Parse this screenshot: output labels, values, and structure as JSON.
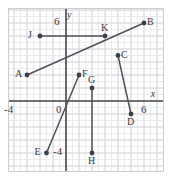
{
  "figure": {
    "title": "",
    "width_px": 171,
    "height_px": 178,
    "frame_color": "#c9ccd1",
    "axis_color": "#4a4a4a",
    "grid_major_color": "#d6d8dc",
    "grid_minor_color": "#ececee",
    "point_color": "#3f3f46",
    "segment_color": "#50505a",
    "background": "#ffffff"
  },
  "axes": {
    "x_label": "x",
    "y_label": "y",
    "xlim": [
      -4.6,
      7.4
    ],
    "ylim": [
      -5.6,
      7.0
    ],
    "unit_px": 13,
    "grid": true,
    "minor_per_major": 2,
    "ticks": {
      "x": [
        {
          "value": -4,
          "label": "-4"
        },
        {
          "value": 6,
          "label": "6"
        }
      ],
      "y": [
        {
          "value": 6,
          "label": "6"
        },
        {
          "value": -4,
          "label": "-4"
        }
      ],
      "origin_label": "0"
    }
  },
  "chart_data": {
    "type": "scatter",
    "title": "",
    "xlabel": "x",
    "ylabel": "y",
    "xlim": [
      -4.6,
      7.4
    ],
    "ylim": [
      -5.6,
      7.0
    ],
    "grid": true,
    "legend": "none",
    "points": [
      {
        "name": "A",
        "x": -3.0,
        "y": 2.0,
        "label": "A",
        "label_side": "left"
      },
      {
        "name": "B",
        "x": 6.0,
        "y": 6.0,
        "label": "B",
        "label_side": "right"
      },
      {
        "name": "C",
        "x": 4.0,
        "y": 3.5,
        "label": "C",
        "label_side": "right"
      },
      {
        "name": "D",
        "x": 5.0,
        "y": -1.0,
        "label": "D",
        "label_side": "below"
      },
      {
        "name": "E",
        "x": -1.5,
        "y": -4.0,
        "label": "E",
        "label_side": "left"
      },
      {
        "name": "F",
        "x": 1.0,
        "y": 2.0,
        "label": "F",
        "label_side": "right"
      },
      {
        "name": "G",
        "x": 2.0,
        "y": 1.0,
        "label": "G",
        "label_side": "above"
      },
      {
        "name": "H",
        "x": 2.0,
        "y": -4.0,
        "label": "H",
        "label_side": "below"
      },
      {
        "name": "J",
        "x": -2.0,
        "y": 5.0,
        "label": "J",
        "label_side": "left"
      },
      {
        "name": "K",
        "x": 3.0,
        "y": 5.0,
        "label": "K",
        "label_side": "above"
      }
    ],
    "segments": [
      {
        "name": "AB",
        "from": "A",
        "to": "B",
        "x1": -3.0,
        "y1": 2.0,
        "x2": 6.0,
        "y2": 6.0
      },
      {
        "name": "JK",
        "from": "J",
        "to": "K",
        "x1": -2.0,
        "y1": 5.0,
        "x2": 3.0,
        "y2": 5.0
      },
      {
        "name": "CD",
        "from": "C",
        "to": "D",
        "x1": 4.0,
        "y1": 3.5,
        "x2": 5.0,
        "y2": -1.0
      },
      {
        "name": "EF",
        "from": "E",
        "to": "F",
        "x1": -1.5,
        "y1": -4.0,
        "x2": 1.0,
        "y2": 2.0
      },
      {
        "name": "GH",
        "from": "G",
        "to": "H",
        "x1": 2.0,
        "y1": 1.0,
        "x2": 2.0,
        "y2": -4.0
      }
    ]
  }
}
